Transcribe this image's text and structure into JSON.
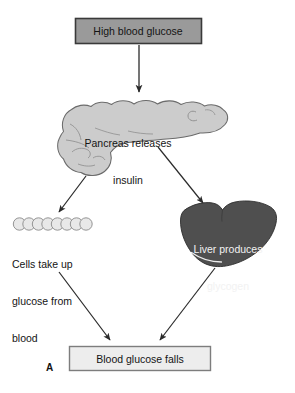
{
  "figure": {
    "panel_letter": "A",
    "background_color": "#ffffff",
    "caption_text_color": "#141414"
  },
  "nodes": {
    "high_glucose_box": {
      "label": "High blood glucose",
      "shape": "rectangle",
      "fill_color": "#9a9a9a",
      "border_color": "#3a3a3a",
      "text_color": "#141414"
    },
    "pancreas": {
      "label_line_1": "Pancreas releases",
      "label_line_2": "insulin",
      "shape": "pancreas-organ",
      "fill_color": "#cccccc",
      "outline_color": "#6b6b6b",
      "text_color": "#141414"
    },
    "cells": {
      "label_line_1": "Cells take up",
      "label_line_2": "glucose from",
      "label_line_3": "blood",
      "shape": "cell-chain",
      "cell_count": 8,
      "fill_color": "#e8e8e8",
      "outline_color": "#8a8a8a",
      "text_color": "#141414"
    },
    "liver": {
      "label_line_1": "Liver produces",
      "label_line_2": "glycogen",
      "shape": "liver-organ",
      "fill_color": "#4f4f4f",
      "outline_color": "#2e2e2e",
      "text_color": "#f2f2f2"
    },
    "glucose_falls_box": {
      "label": "Blood glucose falls",
      "shape": "rectangle",
      "fill_color": "#ededed",
      "border_color": "#7d7d7d",
      "text_color": "#141414"
    }
  },
  "arrows": [
    {
      "name": "arrow-glucose-to-pancreas",
      "from": "high_glucose_box",
      "to": "pancreas",
      "direction": "down",
      "color": "#2b2b2b"
    },
    {
      "name": "arrow-pancreas-to-cells",
      "from": "pancreas",
      "to": "cells",
      "direction": "down-left",
      "color": "#2b2b2b"
    },
    {
      "name": "arrow-pancreas-to-liver",
      "from": "pancreas",
      "to": "liver",
      "direction": "down-right",
      "color": "#2b2b2b"
    },
    {
      "name": "arrow-cells-to-falls",
      "from": "cells",
      "to": "glucose_falls_box",
      "direction": "down-right",
      "color": "#2b2b2b"
    },
    {
      "name": "arrow-liver-to-falls",
      "from": "liver",
      "to": "glucose_falls_box",
      "direction": "down-left",
      "color": "#2b2b2b"
    }
  ]
}
